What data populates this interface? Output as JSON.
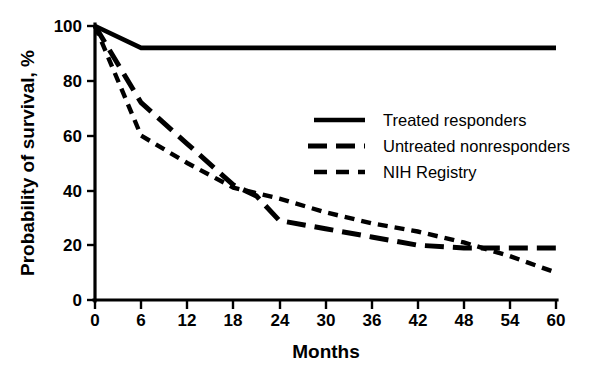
{
  "chart_data": {
    "type": "line",
    "title": "",
    "xlabel": "Months",
    "ylabel": "Probability of survival, %",
    "xlim": [
      0,
      60
    ],
    "ylim": [
      0,
      100
    ],
    "xticks": [
      0,
      6,
      12,
      18,
      24,
      30,
      36,
      42,
      48,
      54,
      60
    ],
    "yticks": [
      0,
      20,
      40,
      60,
      80,
      100
    ],
    "xtick_labels": [
      "0",
      "6",
      "12",
      "18",
      "24",
      "30",
      "36",
      "42",
      "48",
      "54",
      "60"
    ],
    "ytick_labels": [
      "0",
      "20",
      "40",
      "60",
      "80",
      "100"
    ],
    "grid": false,
    "legend_position": "center-right",
    "series": [
      {
        "name": "Treated responders",
        "style": "solid",
        "x": [
          0,
          6,
          12,
          18,
          24,
          30,
          36,
          42,
          48,
          54,
          60
        ],
        "values": [
          100,
          92,
          92,
          92,
          92,
          92,
          92,
          92,
          92,
          92,
          92
        ]
      },
      {
        "name": "Untreated nonresponders",
        "style": "long-dash",
        "x": [
          0,
          6,
          12,
          18,
          21,
          24,
          30,
          36,
          42,
          48,
          54,
          60
        ],
        "values": [
          100,
          72,
          57,
          42,
          38,
          29,
          26,
          23,
          20,
          19,
          19,
          19
        ]
      },
      {
        "name": "NIH Registry",
        "style": "short-dash",
        "x": [
          0,
          6,
          12,
          18,
          24,
          30,
          36,
          42,
          48,
          54,
          60
        ],
        "values": [
          100,
          60,
          50,
          41,
          37,
          32,
          28,
          25,
          21,
          16,
          10
        ]
      }
    ]
  },
  "axes": {
    "y_title": "Probability of survival, %",
    "x_title": "Months"
  },
  "legend": {
    "items": [
      {
        "label": "Treated responders",
        "style": "solid"
      },
      {
        "label": "Untreated nonresponders",
        "style": "long-dash"
      },
      {
        "label": "NIH Registry",
        "style": "short-dash"
      }
    ]
  },
  "colors": {
    "ink": "#000000",
    "background": "#ffffff"
  }
}
